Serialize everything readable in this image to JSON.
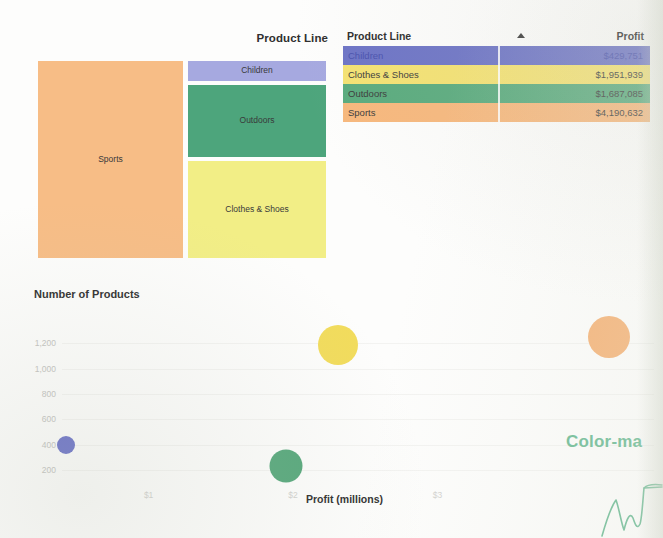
{
  "treemap": {
    "title": "Product Line",
    "tiles": [
      {
        "label": "Sports",
        "color": "#f7bd86"
      },
      {
        "label": "Children",
        "color": "#a6a9e0"
      },
      {
        "label": "Outdoors",
        "color": "#4da57c"
      },
      {
        "label": "Clothes & Shoes",
        "color": "#f2ee86"
      }
    ]
  },
  "table": {
    "columns": {
      "name": "Product Line",
      "value": "Profit"
    },
    "sort_icon": "sort-ascending-icon",
    "rows": [
      {
        "name": "Children",
        "value": "$429,751",
        "color": "#6d74c6"
      },
      {
        "name": "Clothes & Shoes",
        "value": "$1,951,939",
        "color": "#f4e273"
      },
      {
        "name": "Outdoors",
        "value": "$1,687,085",
        "color": "#5aab7e"
      },
      {
        "name": "Sports",
        "value": "$4,190,632",
        "color": "#f7b87d"
      }
    ]
  },
  "annotation": {
    "text": "Color-ma",
    "color": "#67b992"
  },
  "chart_data": {
    "type": "scatter",
    "title": "Number of Products",
    "xlabel": "Profit (millions)",
    "ylabel": "Number of Products",
    "xticks": [
      "$1",
      "$2",
      "$3"
    ],
    "xtick_values": [
      1,
      2,
      3
    ],
    "yticks": [
      "200",
      "400",
      "600",
      "800",
      "1,000",
      "1,200"
    ],
    "ytick_values": [
      200,
      400,
      600,
      800,
      1000,
      1200
    ],
    "xlim": [
      0.4,
      4.5
    ],
    "ylim": [
      100,
      1320
    ],
    "grid": false,
    "legend": "none",
    "points": [
      {
        "name": "Children",
        "x": 0.43,
        "y": 400,
        "size": 18,
        "color": "#6b72c8"
      },
      {
        "name": "Outdoors",
        "x": 1.95,
        "y": 235,
        "size": 33,
        "color": "#57a87c"
      },
      {
        "name": "Clothes & Shoes",
        "x": 2.31,
        "y": 1190,
        "size": 40,
        "color": "#f2dc5c"
      },
      {
        "name": "Sports",
        "x": 4.19,
        "y": 1250,
        "size": 42,
        "color": "#f5b276"
      }
    ]
  }
}
